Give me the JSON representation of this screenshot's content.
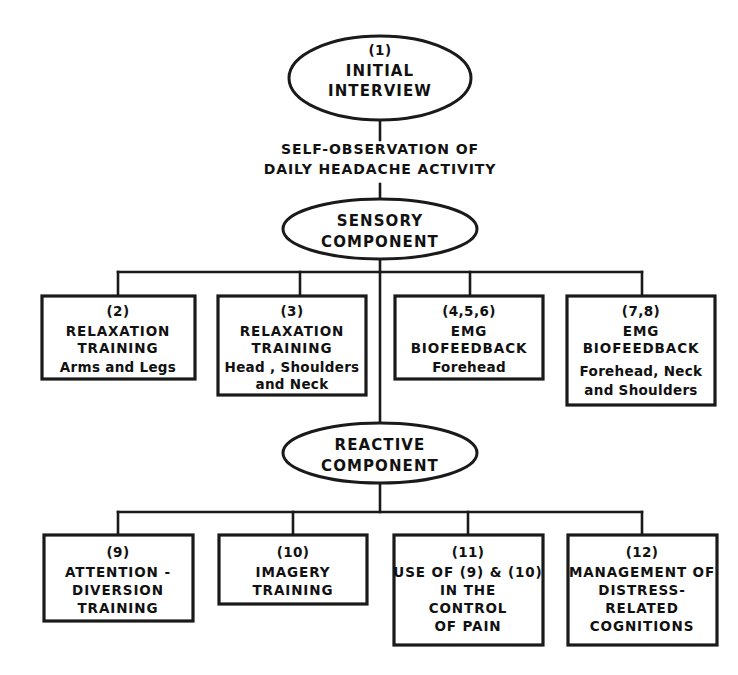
{
  "diagram": {
    "background_color": "#ffffff",
    "line_color": "#1a1a1a",
    "nodes": {
      "initial_interview": {
        "shape": "ellipse",
        "number": "(1)",
        "line1": "INITIAL",
        "line2": "INTERVIEW"
      },
      "self_observation": {
        "shape": "label",
        "line1": "SELF-OBSERVATION OF",
        "line2": "DAILY HEADACHE ACTIVITY"
      },
      "sensory_component": {
        "shape": "ellipse",
        "line1": "SENSORY",
        "line2": "COMPONENT"
      },
      "reactive_component": {
        "shape": "ellipse",
        "line1": "REACTIVE",
        "line2": "COMPONENT"
      }
    },
    "sensory_boxes": [
      {
        "number": "(2)",
        "line1": "RELAXATION",
        "line2": "TRAINING",
        "sub1": "Arms and Legs",
        "sub2": ""
      },
      {
        "number": "(3)",
        "line1": "RELAXATION",
        "line2": "TRAINING",
        "sub1": "Head , Shoulders",
        "sub2": "and Neck"
      },
      {
        "number": "(4,5,6)",
        "line1": "EMG",
        "line2": "BIOFEEDBACK",
        "sub1": "Forehead",
        "sub2": ""
      },
      {
        "number": "(7,8)",
        "line1": "EMG",
        "line2": "BIOFEEDBACK",
        "sub1": "Forehead, Neck",
        "sub2": "and Shoulders"
      }
    ],
    "reactive_boxes": [
      {
        "number": "(9)",
        "line1": "ATTENTION -",
        "line2": "DIVERSION",
        "line3": "TRAINING",
        "line4": ""
      },
      {
        "number": "(10)",
        "line1": "IMAGERY",
        "line2": "TRAINING",
        "line3": "",
        "line4": ""
      },
      {
        "number": "(11)",
        "line1": "USE OF (9) & (10)",
        "line2": "IN THE",
        "line3": "CONTROL",
        "line4": "OF PAIN"
      },
      {
        "number": "(12)",
        "line1": "MANAGEMENT OF",
        "line2": "DISTRESS-",
        "line3": "RELATED",
        "line4": "COGNITIONS"
      }
    ]
  }
}
